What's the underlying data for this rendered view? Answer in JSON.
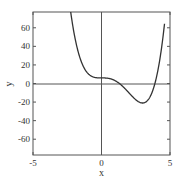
{
  "chart_data": {
    "type": "line",
    "title": "",
    "xlabel": "x",
    "ylabel": "y",
    "xlim": [
      -5,
      5
    ],
    "ylim": [
      -77,
      77
    ],
    "x_ticks": [
      -5,
      0,
      5
    ],
    "x_tick_labels": [
      "-5",
      "0",
      "5"
    ],
    "y_ticks": [
      -60,
      -40,
      -20,
      0,
      20,
      40,
      60
    ],
    "y_tick_labels": [
      "-60",
      "-40",
      "-20",
      "0",
      "20",
      "40",
      "60"
    ],
    "grid": false,
    "zero_lines": true,
    "legend": null,
    "series": [
      {
        "name": "f(x) = x^4 - 4x^3 + 6",
        "color": "#333333",
        "x": [
          -2.3,
          -2.0,
          -1.5,
          -1.0,
          -0.5,
          0.0,
          0.5,
          1.0,
          1.5,
          2.0,
          2.5,
          3.0,
          3.5,
          3.9,
          4.2,
          4.5
        ],
        "y": [
          82.6,
          54.0,
          24.6,
          11.0,
          6.6,
          6.0,
          5.6,
          3.0,
          -2.4,
          -10.0,
          -17.4,
          -21.0,
          -15.4,
          0.0,
          20.3,
          53.3
        ]
      }
    ],
    "annotations": [
      {
        "label": "local minimum",
        "x": 3.0,
        "y": -21.0
      },
      {
        "label": "stationary inflection",
        "x": 0.0,
        "y": 6.0
      }
    ]
  },
  "labels": {
    "xlabel": "x",
    "ylabel": "y",
    "xticks": [
      "-5",
      "0",
      "5"
    ],
    "yticks": [
      "60",
      "40",
      "20",
      "0",
      "-20",
      "-40",
      "-60"
    ]
  }
}
